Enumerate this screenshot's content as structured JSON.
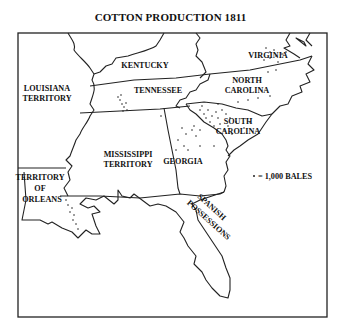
{
  "title": "COTTON PRODUCTION 1811",
  "legend": {
    "symbol": "dot",
    "text": "= 1,000 BALES"
  },
  "regions": [
    {
      "id": "virginia",
      "lines": [
        "VIRGINIA"
      ]
    },
    {
      "id": "kentucky",
      "lines": [
        "KENTUCKY"
      ]
    },
    {
      "id": "louisiana-territory",
      "lines": [
        "LOUISIANA",
        "TERRITORY"
      ]
    },
    {
      "id": "tennessee",
      "lines": [
        "TENNESSEE"
      ]
    },
    {
      "id": "north-carolina",
      "lines": [
        "NORTH",
        "CAROLINA"
      ]
    },
    {
      "id": "south-carolina",
      "lines": [
        "SOUTH",
        "CAROLINA"
      ]
    },
    {
      "id": "mississippi-territory",
      "lines": [
        "MISSISSIPPI",
        "TERRITORY"
      ]
    },
    {
      "id": "georgia",
      "lines": [
        "GEORGIA"
      ]
    },
    {
      "id": "territory-of-orleans",
      "lines": [
        "TERRITORY",
        "OF",
        "ORLEANS"
      ]
    },
    {
      "id": "spanish-possessions",
      "lines": [
        "SPANISH",
        "POSSESSIONS"
      ]
    }
  ]
}
